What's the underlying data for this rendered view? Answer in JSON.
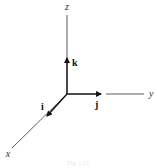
{
  "diagram": {
    "type": "3d-coordinate-axes",
    "colors": {
      "line": "#333333",
      "arrow": "#111111",
      "caption": "#e6e6e6"
    },
    "origin": {
      "x": 67,
      "y": 94
    },
    "axes": [
      {
        "id": "z",
        "label": "z",
        "x2": 67,
        "y2": 15,
        "label_x": 67,
        "label_y": 10
      },
      {
        "id": "y",
        "label": "y",
        "x1": 106,
        "y1": 94,
        "x2": 144,
        "y2": 94,
        "label_x": 149,
        "label_y": 97
      },
      {
        "id": "x",
        "label": "x",
        "x2": 12,
        "y2": 148,
        "label_x": 8,
        "label_y": 157
      }
    ],
    "unit_vectors": [
      {
        "id": "k",
        "label": "k",
        "x2": 67,
        "y2": 58,
        "label_x": 72,
        "label_y": 66
      },
      {
        "id": "j",
        "label": "j",
        "x2": 101,
        "y2": 94,
        "label_x": 95,
        "label_y": 108
      },
      {
        "id": "i",
        "label": "i",
        "x2": 47,
        "y2": 116,
        "label_x": 41,
        "label_y": 110
      }
    ],
    "caption": "Fig. 1.15"
  }
}
